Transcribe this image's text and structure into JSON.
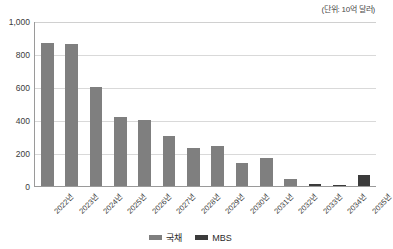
{
  "unit_caption": "(단위: 10억 달러)",
  "legend": {
    "items": [
      {
        "label": "국채",
        "color": "#7f7f7f",
        "key": "gov"
      },
      {
        "label": "MBS",
        "color": "#3b3b3b",
        "key": "mbs"
      }
    ]
  },
  "axis": {
    "y_ticks": [
      "1,000",
      "800",
      "600",
      "400",
      "200",
      "0"
    ],
    "x_ticks": [
      "2022년",
      "2023년",
      "2024년",
      "2025년",
      "2026년",
      "2027년",
      "2028년",
      "2029년",
      "2030년",
      "2031년",
      "2032년",
      "2033년",
      "2034년",
      "2035년"
    ]
  },
  "chart_data": {
    "type": "bar",
    "title": "",
    "subtitle": "",
    "xlabel": "",
    "ylabel": "",
    "unit": "(단위: 10억 달러)",
    "ylim": [
      0,
      1000
    ],
    "ytick_values": [
      0,
      200,
      400,
      600,
      800,
      1000
    ],
    "grid": true,
    "stacked": true,
    "legend_position": "bottom-center",
    "categories": [
      "2022년",
      "2023년",
      "2024년",
      "2025년",
      "2026년",
      "2027년",
      "2028년",
      "2029년",
      "2030년",
      "2031년",
      "2032년",
      "2033년",
      "2034년",
      "2035년"
    ],
    "series": [
      {
        "name": "국채",
        "color": "#7f7f7f",
        "values": [
          865,
          860,
          600,
          418,
          400,
          305,
          230,
          243,
          140,
          168,
          40,
          0,
          0,
          0
        ]
      },
      {
        "name": "MBS",
        "color": "#3b3b3b",
        "values": [
          0,
          0,
          0,
          0,
          0,
          0,
          0,
          0,
          0,
          0,
          0,
          12,
          3,
          68
        ]
      }
    ]
  }
}
